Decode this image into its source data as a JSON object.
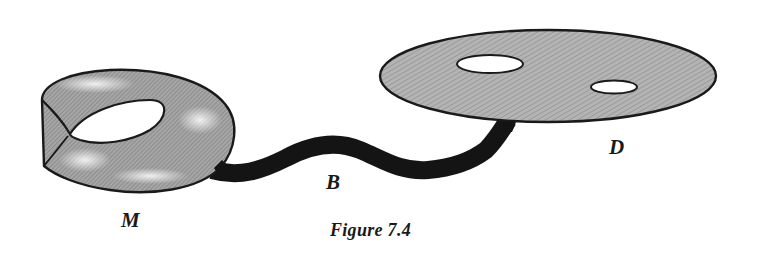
{
  "figure": {
    "caption": "Figure 7.4",
    "labels": {
      "mobius": "M",
      "band": "B",
      "disk": "D"
    },
    "parts": [
      {
        "id": "M",
        "description": "Möbius band"
      },
      {
        "id": "B",
        "description": "Connecting band (dark wavy strip)"
      },
      {
        "id": "D",
        "description": "Disk with two holes"
      }
    ],
    "colors": {
      "outline": "#1a1a1a",
      "band_fill": "#141414",
      "disk_fill": "#a8a8a8",
      "mobius_fill": "#9a9a9a",
      "highlight": "#ececec",
      "background": "#ffffff"
    }
  }
}
